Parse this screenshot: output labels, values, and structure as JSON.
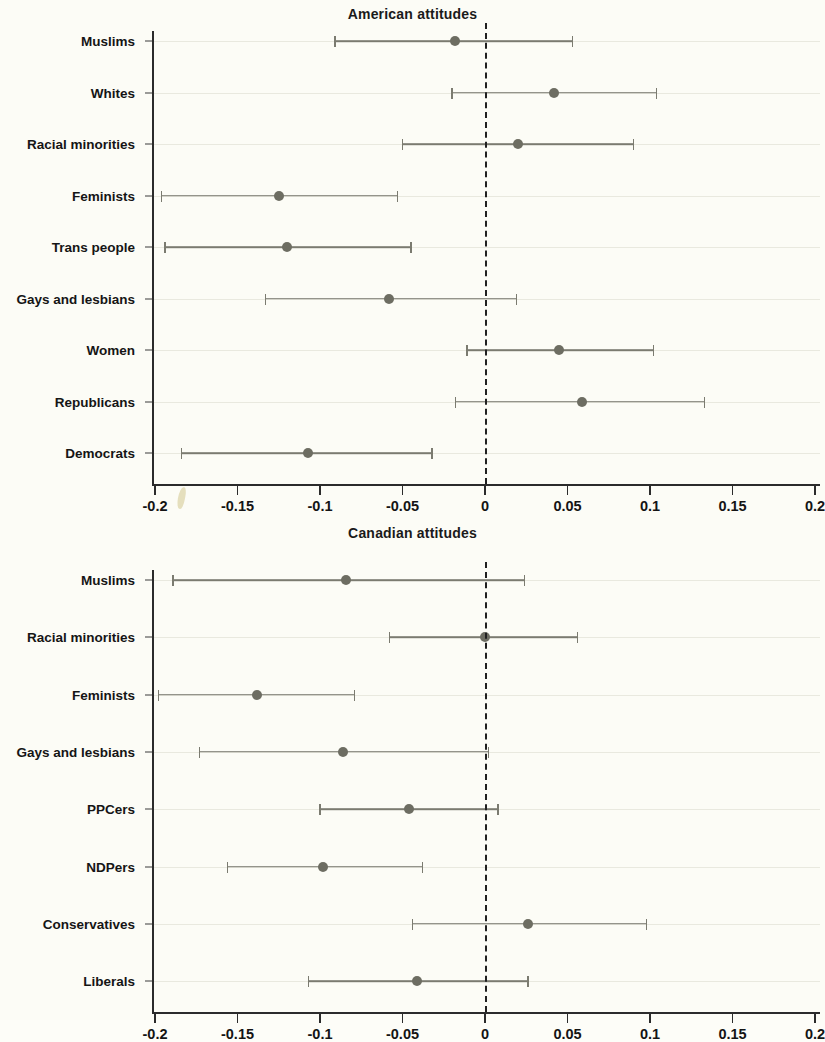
{
  "chart_data": [
    {
      "type": "scatter",
      "id": "american",
      "title": "American attitudes",
      "xlabel": "",
      "ylabel": "",
      "xlim": [
        -0.2,
        0.2
      ],
      "xticks": [
        -0.2,
        -0.15,
        -0.1,
        -0.05,
        0,
        0.05,
        0.1,
        0.15,
        0.2
      ],
      "xtick_labels": [
        "-0.2",
        "-0.15",
        "-0.1",
        "-0.05",
        "0",
        "0.05",
        "0.1",
        "0.15",
        "0.2"
      ],
      "grid": true,
      "legend": "none",
      "reference_line": 0,
      "categories": [
        "Muslims",
        "Whites",
        "Racial minorities",
        "Feminists",
        "Trans people",
        "Gays and lesbians",
        "Women",
        "Republicans",
        "Democrats"
      ],
      "estimates": [
        -0.018,
        0.042,
        0.02,
        -0.125,
        -0.12,
        -0.058,
        0.045,
        0.059,
        -0.107
      ],
      "ci_low": [
        -0.091,
        -0.02,
        -0.05,
        -0.196,
        -0.194,
        -0.133,
        -0.011,
        -0.018,
        -0.184
      ],
      "ci_high": [
        0.053,
        0.104,
        0.09,
        -0.053,
        -0.045,
        0.019,
        0.102,
        0.133,
        -0.032
      ]
    },
    {
      "type": "scatter",
      "id": "canadian",
      "title": "Canadian attitudes",
      "xlabel": "",
      "ylabel": "",
      "xlim": [
        -0.2,
        0.2
      ],
      "xticks": [
        -0.2,
        -0.15,
        -0.1,
        -0.05,
        0,
        0.05,
        0.1,
        0.15,
        0.2
      ],
      "xtick_labels": [
        "-0.2",
        "-0.15",
        "-0.1",
        "-0.05",
        "0",
        "0.05",
        "0.1",
        "0.15",
        "0.2"
      ],
      "grid": true,
      "legend": "none",
      "reference_line": 0,
      "categories": [
        "Muslims",
        "Racial minorities",
        "Feminists",
        "Gays and lesbians",
        "PPCers",
        "NDPers",
        "Conservatives",
        "Liberals"
      ],
      "estimates": [
        -0.084,
        0.0,
        -0.138,
        -0.086,
        -0.046,
        -0.098,
        0.026,
        -0.041
      ],
      "ci_low": [
        -0.189,
        -0.058,
        -0.198,
        -0.173,
        -0.1,
        -0.156,
        -0.044,
        -0.107
      ],
      "ci_high": [
        0.024,
        0.056,
        -0.079,
        0.002,
        0.008,
        -0.038,
        0.098,
        0.026
      ]
    }
  ],
  "style": {
    "marker_color": "#6d6d62",
    "line_color": "#7b7b70",
    "axis_color": "#2b2b2b",
    "grid_color": "#e9e9df",
    "background": "#fcfcf6"
  }
}
